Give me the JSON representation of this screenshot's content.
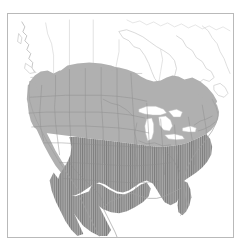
{
  "figure": {
    "kind": "range-map",
    "title": "North America species range map",
    "caption": "",
    "frame_border_color": "#b9b9b9",
    "background_color": "#ffffff"
  },
  "map": {
    "region_name": "North America",
    "projection_hint": "conic",
    "layers": [
      {
        "id": "countries",
        "name": "country-outlines",
        "stroke": "#c9c9c9",
        "fill": "#ffffff",
        "label": "Country outlines (United States, Canada, Mexico)"
      },
      {
        "id": "states",
        "name": "state-province-boundaries",
        "stroke": "#9a9a9a",
        "fill": "none",
        "label": "State and province boundaries"
      },
      {
        "id": "range-solid",
        "name": "range-solid-shading",
        "fill": "#b0b0b0",
        "label": "Range (solid shading)"
      },
      {
        "id": "range-hatched",
        "name": "range-hatched-shading",
        "fill": "#9a9a9a",
        "hatch": "vertical-lines",
        "hatch_stroke": "#7d7d7d",
        "label": "Range (vertical hatch shading)"
      },
      {
        "id": "lakes",
        "name": "great-lakes-water",
        "fill": "#ffffff",
        "stroke": "#bdbdbd",
        "label": "Great Lakes and inland water"
      }
    ],
    "colors": {
      "range_solid": "#b0b0b0",
      "range_hatched": "#9a9a9a",
      "hatch_line": "#7d7d7d",
      "boundary": "#9a9a9a",
      "coastline": "#c9c9c9",
      "water": "#ffffff",
      "frame": "#b9b9b9",
      "page": "#ffffff"
    },
    "legend": {
      "visible": false,
      "entries": []
    },
    "axis_labels": {
      "visible": false
    },
    "scale_bar": {
      "visible": false
    },
    "north_arrow": {
      "visible": false
    }
  }
}
